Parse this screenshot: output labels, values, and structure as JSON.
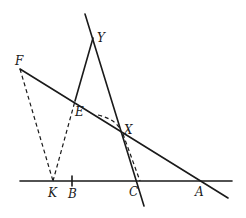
{
  "diagram": {
    "type": "geometric-construction",
    "points": {
      "Y": {
        "label": "Y",
        "x": 93,
        "y": 38
      },
      "F": {
        "label": "F",
        "x": 20,
        "y": 69
      },
      "E": {
        "label": "E",
        "x": 75,
        "y": 101
      },
      "X": {
        "label": "X",
        "x": 121,
        "y": 132
      },
      "K": {
        "label": "K",
        "x": 53,
        "y": 181
      },
      "B": {
        "label": "B",
        "x": 72,
        "y": 181
      },
      "C": {
        "label": "C",
        "x": 137,
        "y": 181
      },
      "A": {
        "label": "A",
        "x": 201,
        "y": 181
      }
    },
    "lines": [
      {
        "name": "base-line",
        "style": "solid",
        "from": [
          20,
          181
        ],
        "to": [
          232,
          181
        ]
      },
      {
        "name": "line-through-Y-C",
        "style": "solid",
        "from": [
          85,
          14
        ],
        "to": [
          144,
          206
        ]
      },
      {
        "name": "line-F-A",
        "style": "solid",
        "from": [
          20,
          69
        ],
        "to": [
          228,
          198
        ]
      },
      {
        "name": "segment-E-Y",
        "style": "solid",
        "from": [
          75,
          101
        ],
        "to": [
          93,
          38
        ]
      },
      {
        "name": "segment-F-K",
        "style": "dashed",
        "from": [
          20,
          69
        ],
        "to": [
          53,
          181
        ]
      },
      {
        "name": "segment-K-E",
        "style": "dashed",
        "from": [
          53,
          181
        ],
        "to": [
          75,
          101
        ]
      },
      {
        "name": "segment-X-C",
        "style": "dashed",
        "from": [
          121,
          132
        ],
        "to": [
          139,
          181
        ]
      }
    ],
    "arcs": [
      {
        "name": "arc-near-X",
        "style": "dashed"
      }
    ],
    "ticks": [
      {
        "name": "tick-B",
        "at": "B"
      }
    ]
  }
}
